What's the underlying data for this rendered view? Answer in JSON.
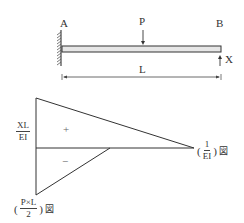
{
  "beam": {
    "support_left_label": "A",
    "support_right_label": "B",
    "load_label": "P",
    "reaction_label": "X",
    "span_label": "L"
  },
  "diagram": {
    "left_label": {
      "numerator": "XL",
      "denominator": "EI"
    },
    "right_label": {
      "open": "(",
      "numerator": "1",
      "denominator": "EI",
      "close": ")",
      "suffix": "図"
    },
    "bottom_label": {
      "open": "(",
      "numerator": "P×L",
      "denominator": "2",
      "close": ")",
      "suffix": "図"
    },
    "positive_sign": "+",
    "negative_sign": "−"
  },
  "colors": {
    "line": "#333333",
    "beam_fill": "#e6e6e6",
    "hatch": "#555555"
  }
}
